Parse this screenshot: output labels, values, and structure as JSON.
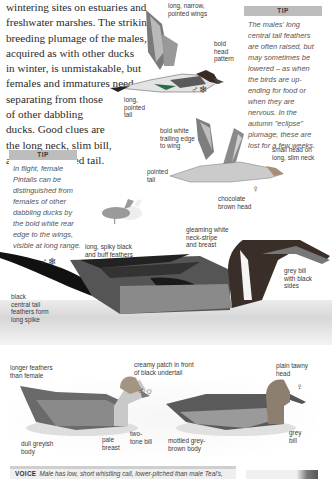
{
  "intro_text": {
    "lines": [
      "wintering sites on estuaries and",
      "freshwater marshes. The striking",
      "breeding plumage of the males,",
      "acquired as with other ducks",
      "in winter, is unmistakable, but",
      "females and immatures need",
      "separating from those",
      "of other dabbling",
      "ducks. Good clues are",
      "the long neck, slim bill,",
      "and more pointed tail."
    ]
  },
  "tip_male": {
    "heading": "TIP",
    "lines": [
      "The males' long",
      "central tail feathers",
      "are often raised, but",
      "may sometimes be",
      "lowered – as when",
      "the birds are up-",
      "ending for food or",
      "when they are",
      "nervous. In the",
      "autumn \"eclipse\"",
      "plumage, these are",
      "lost for a few weeks."
    ]
  },
  "tip_female": {
    "heading": "TIP",
    "lines": [
      "In flight, female",
      "Pintails can be",
      "distinguished from",
      "females of other",
      "dabbling ducks by",
      "the bold white rear",
      "edge to the wings,",
      "visible at long range."
    ]
  },
  "flight_male": {
    "labels": {
      "wings": [
        "long, narrow,",
        "pointed wings"
      ],
      "head": [
        "bold",
        "head",
        "pattern"
      ],
      "tail": [
        "long,",
        "pointed",
        "tail"
      ]
    },
    "symbol": "♂❄"
  },
  "flight_female": {
    "labels": {
      "trailing": [
        "bold white",
        "trailing edge",
        "to wing"
      ],
      "head": [
        "small head on",
        "long, slim neck"
      ],
      "tail": [
        "pointed",
        "tail"
      ]
    },
    "symbol": "♀"
  },
  "swimming_male": {
    "labels": {
      "head": [
        "chocolate",
        "brown head"
      ],
      "neck": [
        "gleaming white",
        "neck-stripe",
        "and breast"
      ],
      "feathers": [
        "long, spiky black",
        "and buff feathers"
      ],
      "bill": [
        "grey bill",
        "with black",
        "sides"
      ],
      "tail": [
        "black",
        "central tail",
        "feathers form",
        "long spike"
      ],
      "patch": [
        "creamy patch in front",
        "of black undertail"
      ]
    },
    "symbol": "♂❄"
  },
  "eclipse_male": {
    "labels": {
      "feathers": [
        "longer feathers",
        "than female"
      ],
      "body": [
        "dull greyish",
        "body"
      ],
      "breast": [
        "pale",
        "breast"
      ],
      "bill": [
        "two-",
        "tone bill"
      ]
    },
    "symbol": "♂☼"
  },
  "female_swimming": {
    "labels": {
      "head": [
        "plain tawny",
        "head"
      ],
      "body": [
        "mottled grey-",
        "brown body"
      ],
      "bill": [
        "grey",
        "bill"
      ]
    },
    "symbol": "♀"
  },
  "voice": {
    "heading": "VOICE",
    "text": "Male has low, short whistling call, lower-pitched than male Teal's,"
  }
}
